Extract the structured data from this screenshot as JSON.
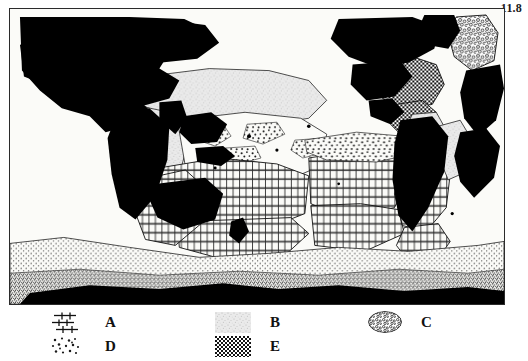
{
  "figure": {
    "number": "11.8"
  },
  "map": {
    "projection": "world-map-pacific-centered",
    "land_color": "#000000",
    "ocean_color": "#fbfbf8",
    "frame_color": "#2b2b2b"
  },
  "legend": {
    "entries": [
      {
        "key": "A",
        "label": "A",
        "pattern": "brick-horizontal-lines-with-ticks",
        "row": 1,
        "column": 1
      },
      {
        "key": "B",
        "label": "B",
        "pattern": "light-gray-fine-stipple",
        "row": 1,
        "column": 2
      },
      {
        "key": "C",
        "label": "C",
        "pattern": "dense-bubble-cloud-oval",
        "row": 1,
        "column": 3
      },
      {
        "key": "D",
        "label": "D",
        "pattern": "scattered-coarse-dots",
        "row": 2,
        "column": 1
      },
      {
        "key": "E",
        "label": "E",
        "pattern": "dense-checkerboard-crosshatch",
        "row": 2,
        "column": 2
      }
    ]
  },
  "colors": {
    "ink": "#111111",
    "land": "#000000",
    "paper": "#ffffff",
    "gray_light": "#cfcfcf",
    "gray_mid": "#9a9a9a"
  }
}
